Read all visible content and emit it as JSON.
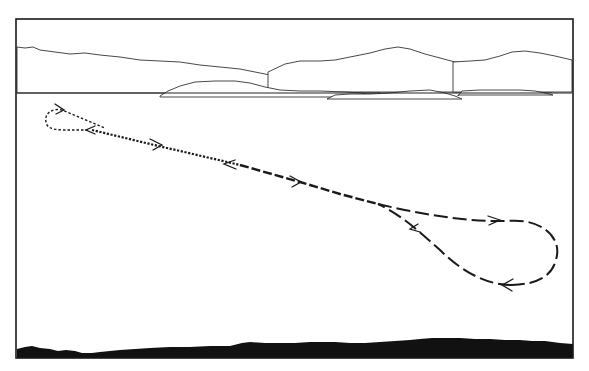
{
  "illustration": {
    "subject": "flight-path-over-water",
    "frame": {
      "x": 16,
      "y": 19,
      "width": 557,
      "height": 339
    },
    "colors": {
      "ink": "#1a1a1a",
      "background": "#ffffff"
    },
    "horizon_y": 93,
    "layers": [
      {
        "name": "distant-mountain-ridges",
        "count": 5
      },
      {
        "name": "horizon-line"
      },
      {
        "name": "flight-path",
        "segments": [
          {
            "style": "fine-dashed",
            "description": "small loop at upper left"
          },
          {
            "style": "dotted",
            "description": "descending straight run"
          },
          {
            "style": "medium-dashed",
            "description": "descending straight run"
          },
          {
            "style": "long-dashed",
            "description": "large loop at lower right"
          }
        ]
      },
      {
        "name": "direction-arrows",
        "count": 8
      },
      {
        "name": "foreground-shoreline",
        "fill": "#111111"
      }
    ]
  }
}
